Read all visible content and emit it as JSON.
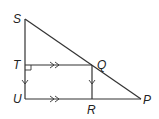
{
  "diagram": {
    "points": {
      "S": {
        "label": "S"
      },
      "T": {
        "label": "T"
      },
      "U": {
        "label": "U"
      },
      "Q": {
        "label": "Q"
      },
      "R": {
        "label": "R"
      },
      "P": {
        "label": "P"
      }
    },
    "segments": [
      "SU",
      "SP",
      "UP",
      "TQ",
      "QR"
    ],
    "markings": {
      "right_angle": "T",
      "parallel_double_arrows": [
        "TQ",
        "UR"
      ],
      "parallel_single_arrows": [
        "TU",
        "QR"
      ]
    },
    "colors": {
      "stroke": "#333333",
      "background": "#ffffff"
    }
  }
}
